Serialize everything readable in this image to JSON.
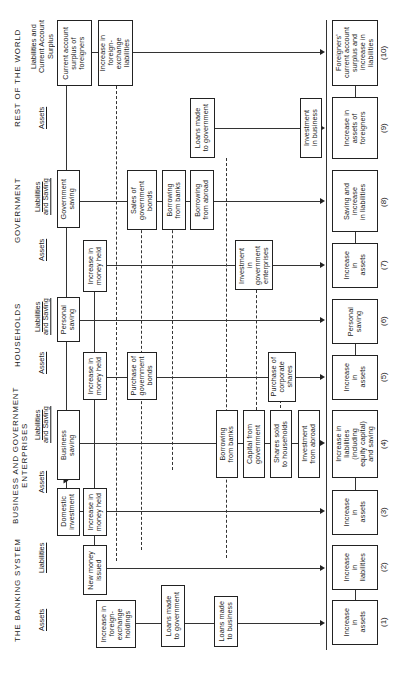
{
  "sectors": {
    "banking": {
      "title": "THE BANKING SYSTEM",
      "assets": "Assets",
      "liabilities": "Liabilities"
    },
    "business": {
      "title": "BUSINESS AND GOVERNMENT\nENTERPRISES",
      "assets": "Assets",
      "liabilities": "Liabilities\nand Saving"
    },
    "households": {
      "title": "HOUSEHOLDS",
      "assets": "Assets",
      "liabilities": "Liabilities\nand Saving"
    },
    "government": {
      "title": "GOVERNMENT",
      "assets": "Assets",
      "liabilities": "Liabilities\nand Saving"
    },
    "rest_of_world": {
      "title": "REST OF THE WORLD",
      "assets": "Assets",
      "liabilities": "Liabilities and\nCurrent Account\nSurplus"
    }
  },
  "items": {
    "fx_holdings": "Increase in\nforeign-\nexchange\nholdings",
    "loans_gov_bank": "Loans made\nto government",
    "loans_business": "Loans made\nto business",
    "new_money": "New money\nissued",
    "domestic_investment": "Domestic\ninvestment",
    "biz_money_held": "Increase in\nmoney held",
    "business_saving": "Business\nsaving",
    "borrowing_banks_biz": "Borrowing\nfrom banks",
    "capital_from_gov": "Capital from\ngovernment",
    "shares_sold": "Shares sold\nto households",
    "investment_abroad": "Investment\nfrom abroad",
    "hh_money_held": "Increase in\nmoney held",
    "purchase_gov_bonds": "Purchase of\ngovernment\nbonds",
    "purchase_corp_shares": "Purchase of\ncorporate\nshares",
    "personal_saving": "Personal\nsaving",
    "gov_money_held": "Increase in\nmoney held",
    "investment_gov_ent": "Investment\nin\ngovernment\nenterprises",
    "government_saving": "Government\nsaving",
    "sales_gov_bonds": "Sales of\ngovernment\nbonds",
    "borrowing_banks_gov": "Borrowing\nfrom banks",
    "borrowing_abroad": "Borrowing\nfrom abroad",
    "loans_to_gov_row": "Loans made\nto government",
    "investment_business": "Investment\nin business",
    "current_account": "Current account\nsurplus of\nforeigners",
    "fx_liabilities": "Increase in\nforeign-\nexchange\nliabilities"
  },
  "totals": [
    {
      "label": "Increase\nin\nassets",
      "num": "(1)"
    },
    {
      "label": "Increase\nin\nliabilities",
      "num": "(2)"
    },
    {
      "label": "Increase\nin\nassets",
      "num": "(3)"
    },
    {
      "label": "Increase in\nliabilities\n(including\nequity capital)\nand saving",
      "num": "(4)"
    },
    {
      "label": "Increase\nin\nassets",
      "num": "(5)"
    },
    {
      "label": "Personal\nsaving",
      "num": "(6)"
    },
    {
      "label": "Increase\nin\nassets",
      "num": "(7)"
    },
    {
      "label": "Saving and\nincrease\nin liabilities",
      "num": "(8)"
    },
    {
      "label": "Increase in\nassets of\nforeigners",
      "num": "(9)"
    },
    {
      "label": "Foreigners'\ncurrent account\nsurplus and\nincrease in\nliabilities",
      "num": "(10)"
    }
  ]
}
